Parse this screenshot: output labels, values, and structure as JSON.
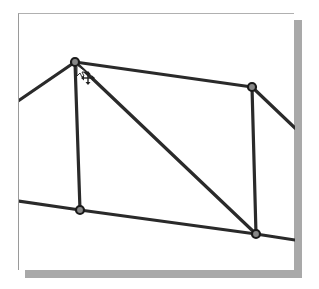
{
  "viewport": {
    "background": "#ffffff",
    "frame_shadow_color": "#a9a9a9",
    "stroke_color": "#2a2a2a"
  },
  "structure": {
    "nodes": [
      {
        "id": "n1",
        "x": 75,
        "y": 62
      },
      {
        "id": "n2",
        "x": 252,
        "y": 87
      },
      {
        "id": "n3",
        "x": 80,
        "y": 210
      },
      {
        "id": "n4",
        "x": 256,
        "y": 234
      }
    ],
    "members": [
      {
        "id": "m1",
        "from": [
          18,
          101
        ],
        "to": [
          75,
          62
        ]
      },
      {
        "id": "m2",
        "from": [
          75,
          62
        ],
        "to": [
          252,
          87
        ]
      },
      {
        "id": "m3",
        "from": [
          252,
          87
        ],
        "to": [
          295,
          128
        ]
      },
      {
        "id": "m4",
        "from": [
          75,
          62
        ],
        "to": [
          80,
          210
        ]
      },
      {
        "id": "m5",
        "from": [
          75,
          62
        ],
        "to": [
          256,
          234
        ]
      },
      {
        "id": "m6",
        "from": [
          252,
          87
        ],
        "to": [
          256,
          234
        ]
      },
      {
        "id": "m7",
        "from": [
          18,
          201
        ],
        "to": [
          80,
          210
        ]
      },
      {
        "id": "m8",
        "from": [
          80,
          210
        ],
        "to": [
          256,
          234
        ]
      },
      {
        "id": "m9",
        "from": [
          256,
          234
        ],
        "to": [
          295,
          240
        ]
      }
    ]
  },
  "cursor": {
    "type": "move-cursor",
    "x": 88,
    "y": 78
  }
}
